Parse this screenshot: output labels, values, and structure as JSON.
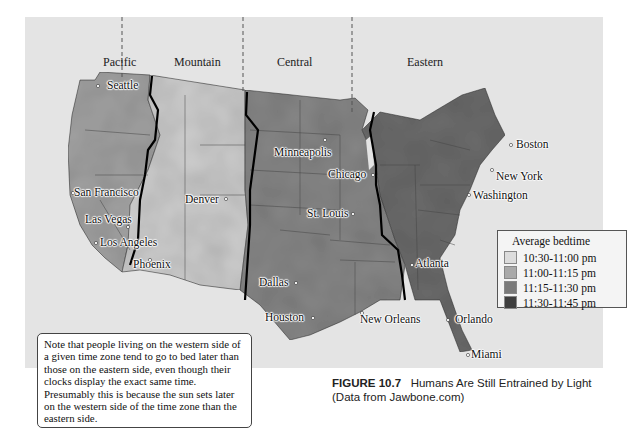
{
  "map": {
    "time_zones": [
      {
        "label": "Pacific"
      },
      {
        "label": "Mountain"
      },
      {
        "label": "Central"
      },
      {
        "label": "Eastern"
      }
    ],
    "cities": [
      {
        "name": "Seattle"
      },
      {
        "name": "San Francisco"
      },
      {
        "name": "Las Vegas"
      },
      {
        "name": "Los Angeles"
      },
      {
        "name": "Phoenix"
      },
      {
        "name": "Denver"
      },
      {
        "name": "Minneapolis"
      },
      {
        "name": "Chicago"
      },
      {
        "name": "St. Louis"
      },
      {
        "name": "Dallas"
      },
      {
        "name": "Houston"
      },
      {
        "name": "New Orleans"
      },
      {
        "name": "Atlanta"
      },
      {
        "name": "Orlando"
      },
      {
        "name": "Miami"
      },
      {
        "name": "Washington"
      },
      {
        "name": "New York"
      },
      {
        "name": "Boston"
      }
    ],
    "legend": {
      "title": "Average bedtime",
      "items": [
        {
          "label": "10:30-11:00 pm",
          "color": "#dcdcdc"
        },
        {
          "label": "11:00-11:15 pm",
          "color": "#a9a9a9"
        },
        {
          "label": "11:15-11:30 pm",
          "color": "#7a7a7a"
        },
        {
          "label": "11:30-11:45 pm",
          "color": "#3e3e3e"
        }
      ]
    }
  },
  "note": "Note that people living on the western side of a given time zone tend to go to bed later than those on the eastern side, even though their clocks display the exact same time. Presumably this is because the sun sets later on the western side of the time zone than the eastern side.",
  "caption": {
    "figure_number": "FIGURE 10.7",
    "title": "Humans Are Still Entrained by Light",
    "source": "(Data from Jawbone.com)"
  }
}
